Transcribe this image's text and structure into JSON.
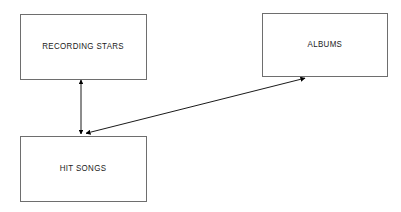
{
  "diagram": {
    "type": "entity-relationship-diagram",
    "background_color": "#ffffff",
    "line_color": "#000000",
    "border_color": "#6e6e6e",
    "text_color": "#1a1a1a",
    "entities": [
      {
        "id": "recording-stars",
        "label": "RECORDING STARS",
        "x": 20,
        "y": 14,
        "width": 127,
        "height": 66
      },
      {
        "id": "albums",
        "label": "ALBUMS",
        "x": 262,
        "y": 13,
        "width": 126,
        "height": 64
      },
      {
        "id": "hit-songs",
        "label": "HIT SONGS",
        "x": 20,
        "y": 136,
        "width": 127,
        "height": 66
      }
    ],
    "relationships": [
      {
        "id": "recording-stars-hit-songs",
        "from": "recording-stars",
        "to": "hit-songs",
        "arrow_style": "double-headed",
        "orientation": "vertical",
        "x1": 81,
        "y1": 78,
        "x2": 81,
        "y2": 136
      },
      {
        "id": "hit-songs-albums",
        "from": "hit-songs",
        "to": "albums",
        "arrow_style": "double-headed",
        "orientation": "diagonal",
        "x1": 84,
        "y1": 134,
        "x2": 307,
        "y2": 77
      }
    ]
  }
}
